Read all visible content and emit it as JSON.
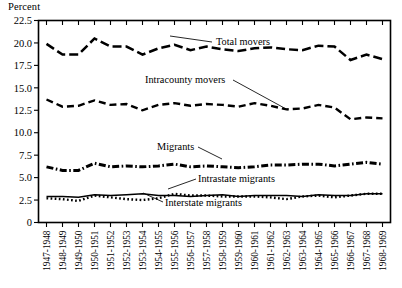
{
  "chart_data": {
    "type": "line",
    "title": "",
    "ylabel": "Percent",
    "xlabel": "",
    "ylim": [
      0,
      22.5
    ],
    "ytick_labels": [
      "0",
      "2.5",
      "5.0",
      "7.5",
      "10.0",
      "12.5",
      "15.0",
      "17.5",
      "20.0",
      "22.5"
    ],
    "ytick_values": [
      0,
      2.5,
      5,
      7.5,
      10,
      12.5,
      15,
      17.5,
      20,
      22.5
    ],
    "grid": false,
    "legend_position": "inline-annotations",
    "categories": [
      "1947-1948",
      "1948-1949",
      "1949-1950",
      "1950-1951",
      "1951-1952",
      "1952-1953",
      "1953-1954",
      "1954-1955",
      "1955-1956",
      "1956-1957",
      "1957-1958",
      "1958-1959",
      "1959-1960",
      "1960-1961",
      "1961-1962",
      "1962-1963",
      "1963-1964",
      "1964-1965",
      "1965-1966",
      "1966-1967",
      "1967-1968",
      "1968-1969"
    ],
    "series": [
      {
        "name": "Total movers",
        "style": "long-dash",
        "values": [
          19.9,
          18.7,
          18.7,
          20.5,
          19.6,
          19.6,
          18.7,
          19.4,
          19.8,
          19.2,
          19.6,
          19.3,
          19.1,
          19.4,
          19.5,
          19.3,
          19.2,
          19.7,
          19.6,
          18.1,
          18.7,
          18.2
        ]
      },
      {
        "name": "Intracounty movers",
        "style": "dashed",
        "values": [
          13.7,
          12.9,
          13.0,
          13.6,
          13.1,
          13.2,
          12.5,
          13.1,
          13.3,
          13.0,
          13.2,
          13.1,
          12.9,
          13.3,
          13.0,
          12.6,
          12.7,
          13.1,
          12.8,
          11.5,
          11.7,
          11.6
        ]
      },
      {
        "name": "Migrants",
        "style": "dash-dot",
        "values": [
          6.2,
          5.8,
          5.8,
          6.6,
          6.2,
          6.3,
          6.2,
          6.3,
          6.5,
          6.2,
          6.3,
          6.2,
          6.1,
          6.2,
          6.4,
          6.4,
          6.5,
          6.5,
          6.3,
          6.5,
          6.7,
          6.5
        ]
      },
      {
        "name": "Intrastate migrants",
        "style": "solid",
        "values": [
          2.9,
          2.9,
          2.8,
          3.1,
          3.0,
          3.1,
          3.2,
          3.0,
          3.0,
          2.9,
          3.0,
          3.1,
          2.9,
          3.0,
          3.0,
          3.0,
          2.9,
          3.1,
          3.0,
          3.0,
          3.2,
          3.2
        ]
      },
      {
        "name": "Interstate migrants",
        "style": "dotted",
        "values": [
          2.7,
          2.6,
          2.4,
          3.0,
          2.8,
          2.6,
          2.5,
          2.7,
          3.2,
          3.0,
          3.0,
          2.9,
          2.9,
          2.9,
          2.8,
          2.6,
          2.9,
          3.0,
          2.8,
          3.0,
          3.2,
          3.2
        ]
      }
    ],
    "annotations": [
      {
        "label": "Total movers",
        "text_x": 216,
        "text_y": 45,
        "leader_from_x": 212,
        "leader_from_y": 42,
        "leader_to_x": 170,
        "leader_to_y": 36
      },
      {
        "label": "Intracounty movers",
        "text_x": 145,
        "text_y": 83,
        "leader_from_x": 233,
        "leader_from_y": 80,
        "leader_to_x": 288,
        "leader_to_y": 110
      },
      {
        "label": "Migrants",
        "text_x": 157,
        "text_y": 150,
        "leader_from_x": 198,
        "leader_from_y": 147,
        "leader_to_x": 222,
        "leader_to_y": 159
      },
      {
        "label": "Intrastate migrants",
        "text_x": 198,
        "text_y": 182,
        "leader_from_x": 196,
        "leader_from_y": 179,
        "leader_to_x": 168,
        "leader_to_y": 189
      },
      {
        "label": "Interstate migrants",
        "text_x": 165,
        "text_y": 206,
        "leader_from_x": 163,
        "leader_from_y": 202,
        "leader_to_x": 143,
        "leader_to_y": 193
      }
    ]
  }
}
